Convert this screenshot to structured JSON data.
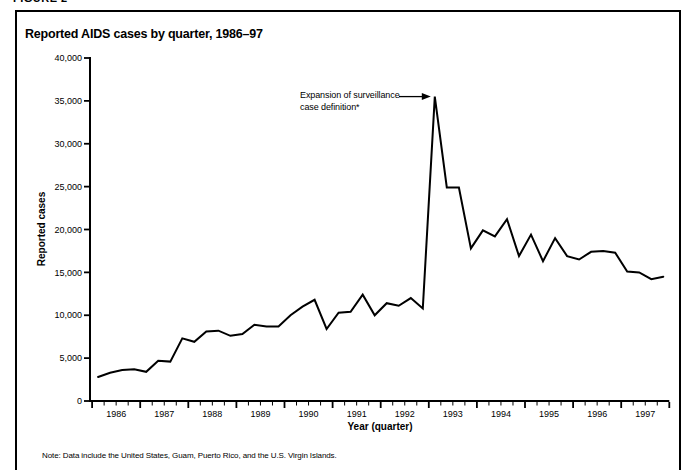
{
  "page": {
    "figure_label": "FIGURE 2",
    "note": "Note: Data include the United States, Guam, Puerto Rico, and the U.S. Virgin Islands."
  },
  "chart_data": {
    "type": "line",
    "title": "Reported AIDS cases by quarter, 1986–97",
    "xlabel": "Year (quarter)",
    "ylabel": "Reported cases",
    "ylim": [
      0,
      40000
    ],
    "grid": false,
    "line_color": "#000000",
    "y_ticks": [
      0,
      5000,
      10000,
      15000,
      20000,
      25000,
      30000,
      35000,
      40000
    ],
    "y_tick_labels": [
      "0",
      "5,000",
      "10,000",
      "15,000",
      "20,000",
      "25,000",
      "30,000",
      "35,000",
      "40,000"
    ],
    "years": [
      "1986",
      "1987",
      "1988",
      "1989",
      "1990",
      "1991",
      "1992",
      "1993",
      "1994",
      "1995",
      "1996",
      "1997"
    ],
    "quarters_per_year": 4,
    "annotation": {
      "line1": "Expansion of surveillance",
      "line2": "case definition*",
      "target": "1993 Q1 peak",
      "value_at_target": 35500
    },
    "series": [
      {
        "name": "Reported AIDS cases",
        "x_start": "1986 Q1",
        "values": [
          2800,
          3300,
          3600,
          3700,
          3400,
          4700,
          4600,
          7300,
          6900,
          8100,
          8200,
          7600,
          7800,
          8900,
          8700,
          8700,
          10000,
          11000,
          11800,
          8400,
          10300,
          10400,
          12400,
          10000,
          11400,
          11100,
          12000,
          10800,
          35500,
          24900,
          24900,
          17800,
          19900,
          19200,
          21200,
          16900,
          19400,
          16300,
          19000,
          16900,
          16500,
          17400,
          17500,
          17300,
          15100,
          15000,
          14200,
          14500
        ]
      }
    ]
  }
}
